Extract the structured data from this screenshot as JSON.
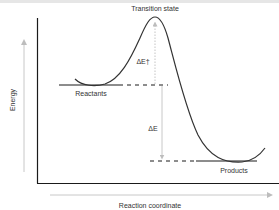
{
  "diagram": {
    "type": "energy-profile",
    "title_label": "Transition state",
    "axes": {
      "y_label": "Energy",
      "x_label": "Reaction coordinate"
    },
    "levels": {
      "reactants_label": "Reactants",
      "products_label": "Products"
    },
    "annotations": {
      "activation_energy": "ΔE†",
      "energy_change": "ΔE"
    },
    "colors": {
      "axis": "#1a1a1a",
      "curve": "#333333",
      "guide_arrow": "#bdbdbd",
      "text": "#333333",
      "top_bar": "#e6e6e6"
    }
  }
}
